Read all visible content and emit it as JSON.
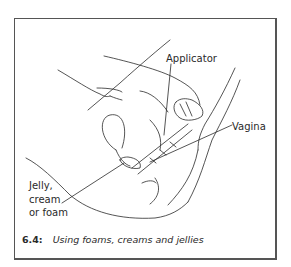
{
  "figure": {
    "number": "6.4:",
    "caption": "Using foams, creams and jellies"
  },
  "labels": {
    "applicator": "Applicator",
    "vagina": "Vagina",
    "jelly_line1": "Jelly,",
    "jelly_line2": "cream",
    "jelly_line3": "or foam"
  },
  "colors": {
    "line": "#2a2a2a",
    "border": "#555555",
    "background": "#ffffff"
  }
}
